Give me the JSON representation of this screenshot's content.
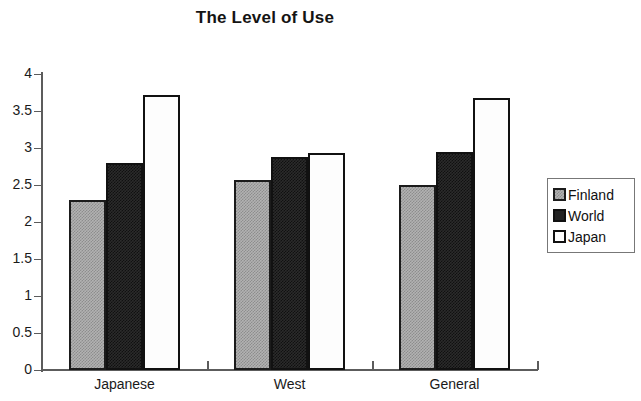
{
  "chart_data": {
    "type": "bar",
    "title": "The Level of Use",
    "xlabel": "",
    "ylabel": "",
    "categories": [
      "Japanese",
      "West",
      "General"
    ],
    "series": [
      {
        "name": "Finland",
        "values": [
          2.3,
          2.57,
          2.5
        ],
        "color": "#b2b2b2"
      },
      {
        "name": "World",
        "values": [
          2.8,
          2.88,
          2.95
        ],
        "color": "#242424"
      },
      {
        "name": "Japan",
        "values": [
          3.72,
          2.93,
          3.68
        ],
        "color": "#ffffff"
      }
    ],
    "ylim": [
      0,
      4
    ],
    "yticks": [
      "0",
      "0.5",
      "1",
      "1.5",
      "2",
      "2.5",
      "3",
      "3.5",
      "4"
    ],
    "ytick_values": [
      0,
      0.5,
      1,
      1.5,
      2,
      2.5,
      3,
      3.5,
      4
    ],
    "grid": false,
    "legend_position": "right"
  },
  "legend": {
    "items": [
      {
        "label": "Finland"
      },
      {
        "label": "World"
      },
      {
        "label": "Japan"
      }
    ]
  }
}
